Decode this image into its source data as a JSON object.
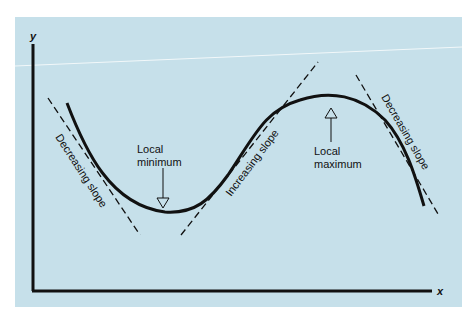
{
  "diagram": {
    "type": "function-curve-slope-illustration",
    "background_color": "#c6e0ea",
    "axes": {
      "x_label": "x",
      "y_label": "y"
    },
    "annotations": {
      "left_tangent": "Decreasing slope",
      "local_minimum_line1": "Local",
      "local_minimum_line2": "minimum",
      "middle_tangent": "Increasing slope",
      "local_maximum_line1": "Local",
      "local_maximum_line2": "maximum",
      "right_tangent": "Decreasing slope"
    }
  }
}
